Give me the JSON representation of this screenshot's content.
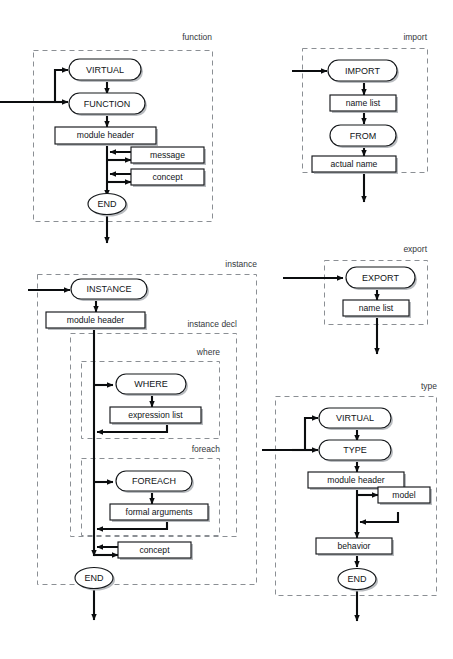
{
  "page": {
    "background": "#ffffff",
    "ink": "#0b0d0f",
    "dash_color": "#8b8f94",
    "shadow_color": "#b9bcc0"
  },
  "diagrams": [
    {
      "id": "function",
      "label": "function",
      "nodes": [
        {
          "key": "virtual",
          "text": "VIRTUAL",
          "shape": "terminal"
        },
        {
          "key": "function",
          "text": "FUNCTION",
          "shape": "terminal"
        },
        {
          "key": "module_header",
          "text": "module header",
          "shape": "nonterminal"
        },
        {
          "key": "message",
          "text": "message",
          "shape": "nonterminal"
        },
        {
          "key": "concept",
          "text": "concept",
          "shape": "nonterminal"
        },
        {
          "key": "end",
          "text": "END",
          "shape": "terminal"
        }
      ]
    },
    {
      "id": "import",
      "label": "import",
      "nodes": [
        {
          "key": "import",
          "text": "IMPORT",
          "shape": "terminal"
        },
        {
          "key": "name_list",
          "text": "name list",
          "shape": "nonterminal"
        },
        {
          "key": "from",
          "text": "FROM",
          "shape": "terminal"
        },
        {
          "key": "actual_name",
          "text": "actual name",
          "shape": "nonterminal"
        }
      ]
    },
    {
      "id": "export",
      "label": "export",
      "nodes": [
        {
          "key": "export",
          "text": "EXPORT",
          "shape": "terminal"
        },
        {
          "key": "name_list",
          "text": "name list",
          "shape": "nonterminal"
        }
      ]
    },
    {
      "id": "instance",
      "label": "instance",
      "sublabels": [
        "instance decl",
        "where",
        "foreach"
      ],
      "nodes": [
        {
          "key": "instance",
          "text": "INSTANCE",
          "shape": "terminal"
        },
        {
          "key": "module_header",
          "text": "module header",
          "shape": "nonterminal"
        },
        {
          "key": "where",
          "text": "WHERE",
          "shape": "terminal"
        },
        {
          "key": "expression_list",
          "text": "expression list",
          "shape": "nonterminal"
        },
        {
          "key": "foreach",
          "text": "FOREACH",
          "shape": "terminal"
        },
        {
          "key": "formal_args",
          "text": "formal arguments",
          "shape": "nonterminal"
        },
        {
          "key": "concept",
          "text": "concept",
          "shape": "nonterminal"
        },
        {
          "key": "end",
          "text": "END",
          "shape": "terminal"
        }
      ]
    },
    {
      "id": "type",
      "label": "type",
      "nodes": [
        {
          "key": "virtual",
          "text": "VIRTUAL",
          "shape": "terminal"
        },
        {
          "key": "type",
          "text": "TYPE",
          "shape": "terminal"
        },
        {
          "key": "module_header",
          "text": "module header",
          "shape": "nonterminal"
        },
        {
          "key": "model",
          "text": "model",
          "shape": "nonterminal"
        },
        {
          "key": "behavior",
          "text": "behavior",
          "shape": "nonterminal"
        },
        {
          "key": "end",
          "text": "END",
          "shape": "terminal"
        }
      ]
    }
  ]
}
